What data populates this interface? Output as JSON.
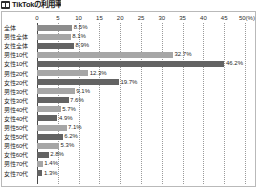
{
  "header": {
    "icon": "grid-badge-icon",
    "title": "TikTokの利用率"
  },
  "chart_data": {
    "type": "bar",
    "orientation": "horizontal",
    "title": "TikTokの利用率",
    "xlabel": "",
    "ylabel": "",
    "unit_label": "(%)",
    "xlim": [
      0,
      50
    ],
    "grid": true,
    "legend": "none",
    "ticks": [
      "0",
      "5",
      "10",
      "15",
      "20",
      "25",
      "30",
      "35",
      "40",
      "45",
      "50"
    ],
    "categories": [
      "全体",
      "男性全体",
      "女性全体",
      "男性10代",
      "女性10代",
      "男性20代",
      "女性20代",
      "男性30代",
      "女性30代",
      "男性40代",
      "女性40代",
      "男性50代",
      "女性50代",
      "男性60代",
      "女性60代",
      "男性70代",
      "女性70代"
    ],
    "values": [
      8.5,
      8.1,
      8.9,
      32.7,
      46.2,
      12.3,
      19.7,
      9.1,
      7.6,
      5.7,
      4.9,
      7.1,
      6.2,
      5.3,
      2.8,
      1.4,
      1.3
    ],
    "value_labels": [
      "8.5%",
      "8.1%",
      "8.9%",
      "32.7%",
      "46.2%",
      "12.3%",
      "19.7%",
      "9.1%",
      "7.6%",
      "5.7%",
      "4.9%",
      "7.1%",
      "6.2%",
      "5.3%",
      "2.8%",
      "1.4%",
      "1.3%"
    ],
    "series_kinds": [
      "total",
      "male",
      "female",
      "male",
      "female",
      "male",
      "female",
      "male",
      "female",
      "male",
      "female",
      "male",
      "female",
      "male",
      "female",
      "male",
      "female"
    ]
  },
  "colors": {
    "bar_male": "#a6a6a6",
    "bar_female": "#636363",
    "bar_total": "#8c8c8c",
    "frame": "#b9b9b9",
    "grid": "#9a9a9a",
    "axis": "#4a4a4a",
    "text": "#1f1f1f"
  }
}
